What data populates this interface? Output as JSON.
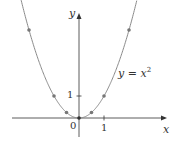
{
  "chart_data": {
    "type": "line",
    "title": "",
    "xlabel": "x",
    "ylabel": "y",
    "series": [
      {
        "name": "y = x^2",
        "x": [
          -2,
          -1,
          -0.5,
          0,
          0.5,
          1,
          2
        ],
        "y": [
          4,
          1,
          0.25,
          0,
          0.25,
          1,
          4
        ]
      }
    ],
    "curve_label": "y = x²",
    "x_ticks": [
      "0",
      "1"
    ],
    "y_ticks": [
      "1"
    ],
    "xlim": [
      -2.6,
      2.8
    ],
    "ylim": [
      -0.8,
      4.9
    ],
    "grid": false,
    "colors": {
      "curve": "#888888",
      "points": "#777777",
      "axes": "#333333"
    }
  },
  "labels": {
    "x_axis": "x",
    "y_axis": "y",
    "curve": "y = x",
    "curve_exp": "2",
    "origin": "0",
    "x_tick_1": "1",
    "y_tick_1": "1"
  }
}
